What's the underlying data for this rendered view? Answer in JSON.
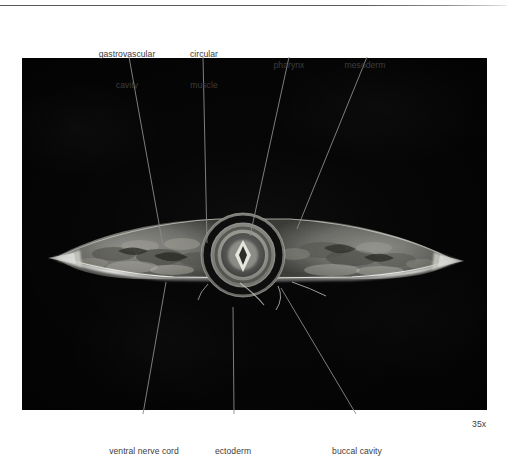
{
  "figure": {
    "kind": "light-micrograph",
    "magnification_label": "35x",
    "plate": {
      "background_color": "#060606",
      "left": 22,
      "top": 58,
      "width": 465,
      "height": 352
    },
    "rule_color": "#595959",
    "label_color": "#3d3d3d",
    "leader_color": "#8a8a8a"
  },
  "labels": {
    "top": [
      {
        "name": "gastrovascular-cavity",
        "text": "gastrovascular\ncavity",
        "line1": "gastrovascular",
        "line2": "cavity",
        "x": 87,
        "y": 28,
        "width": 80
      },
      {
        "name": "circular-muscle",
        "text": "circular\nmuscle",
        "line1": "circular",
        "line2": "muscle",
        "x": 178,
        "y": 28,
        "width": 52
      },
      {
        "name": "pharynx",
        "text": "pharynx",
        "line1": "pharynx",
        "line2": "",
        "x": 265,
        "y": 39,
        "width": 48
      },
      {
        "name": "mesoderm",
        "text": "mesoderm",
        "line1": "mesoderm",
        "line2": "",
        "x": 336,
        "y": 39,
        "width": 58
      }
    ],
    "bottom": [
      {
        "name": "ventral-nerve-cord",
        "text": "ventral nerve cord",
        "x": 100,
        "y": 425,
        "width": 88
      },
      {
        "name": "ectoderm",
        "text": "ectoderm",
        "x": 205,
        "y": 425,
        "width": 56
      },
      {
        "name": "buccal-cavity",
        "text": "buccal cavity",
        "x": 322,
        "y": 425,
        "width": 70
      }
    ],
    "magnification": {
      "name": "magnification",
      "text": "35x",
      "x": 472,
      "y": 419
    }
  },
  "leaders": [
    {
      "name": "leader-gastrovascular-cavity",
      "x1": 129,
      "y1": 57,
      "x2": 163,
      "y2": 246
    },
    {
      "name": "leader-circular-muscle",
      "x1": 203,
      "y1": 57,
      "x2": 207,
      "y2": 243
    },
    {
      "name": "leader-pharynx",
      "x1": 289,
      "y1": 57,
      "x2": 250,
      "y2": 236
    },
    {
      "name": "leader-mesoderm",
      "x1": 367,
      "y1": 57,
      "x2": 297,
      "y2": 229
    },
    {
      "name": "leader-ventral-nerve-cord",
      "x1": 166,
      "y1": 282,
      "x2": 143,
      "y2": 414
    },
    {
      "name": "leader-ectoderm",
      "x1": 233,
      "y1": 307,
      "x2": 234,
      "y2": 414
    },
    {
      "name": "leader-buccal-cavity",
      "x1": 281,
      "y1": 288,
      "x2": 356,
      "y2": 414
    }
  ],
  "specimen": {
    "description": "flatworm transverse section, dark-field light micrograph",
    "body_outline_color": "#d8d8d4",
    "tissue_color": "#7c7c78",
    "pharynx_rings": [
      {
        "name": "pharynx-outer-ring",
        "r": 42,
        "color": "#9a9a95"
      },
      {
        "name": "pharynx-dark-ring",
        "r": 35,
        "color": "#161616"
      },
      {
        "name": "pharynx-mid-ring",
        "r": 30,
        "color": "#8e8e89"
      },
      {
        "name": "pharynx-inner-ring",
        "r": 20,
        "color": "#5c5c58"
      },
      {
        "name": "pharynx-lumen",
        "r": 9,
        "color": "#cfcfc9"
      }
    ],
    "center": {
      "x": 243,
      "y": 255
    }
  }
}
